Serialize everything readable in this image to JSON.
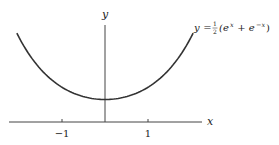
{
  "chart_data": {
    "type": "line",
    "title": "",
    "xlabel": "x",
    "ylabel": "y",
    "x_ticks": [
      -1,
      1
    ],
    "x_tick_labels": [
      "−1",
      "1"
    ],
    "xlim": [
      -2.05,
      2.25
    ],
    "ylim": [
      0,
      4.3
    ],
    "grid": false,
    "legend": null,
    "series": [
      {
        "name": "y = ½(e^x + e^−x)",
        "function": "cosh(x)",
        "x": [
          -2.05,
          -1.5,
          -1,
          -0.5,
          0,
          0.5,
          1,
          1.5,
          2.05
        ],
        "values": [
          3.95,
          2.35,
          1.54,
          1.13,
          1.0,
          1.13,
          1.54,
          2.35,
          3.95
        ]
      }
    ],
    "annotations": [
      {
        "text": "y = ½(e^x + e^−x)",
        "position": "right end of curve"
      }
    ]
  },
  "labels": {
    "y_axis": "y",
    "x_axis": "x",
    "tick_neg1": "−1",
    "tick_pos1": "1",
    "eq_y": "y",
    "eq_equals": " = ",
    "eq_half_num": "1",
    "eq_half_den": "2",
    "eq_open": "(e",
    "eq_exp1": "x",
    "eq_plus": " + e",
    "eq_exp2": "−x",
    "eq_close": ")"
  },
  "colors": {
    "curve": "#333333",
    "axes": "#444444",
    "text": "#222222"
  }
}
